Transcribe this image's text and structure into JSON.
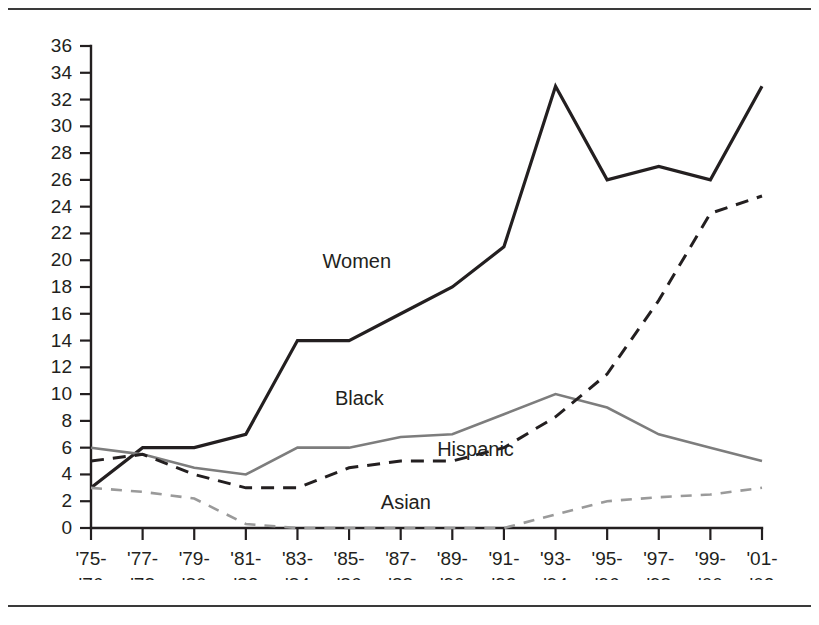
{
  "figure": {
    "top_rule": "",
    "bottom_rule": ""
  },
  "chart_data": {
    "type": "line",
    "title": "",
    "xlabel": "",
    "ylabel": "",
    "ylim": [
      0,
      36
    ],
    "ytick_step": 2,
    "grid": false,
    "legend_position": "inline-labels",
    "categories": [
      "'75-\n'76",
      "'77-\n'78",
      "'79-\n'80",
      "'81-\n'82",
      "'83-\n'84",
      "'85-\n'86",
      "'87-\n'88",
      "'89-\n'90",
      "'91-\n'92",
      "'93-\n'94",
      "'95-\n'96",
      "'97-\n'98",
      "'99-\n'00",
      "'01-\n'02"
    ],
    "categories_line1": [
      "'75-",
      "'77-",
      "'79-",
      "'81-",
      "'83-",
      "'85-",
      "'87-",
      "'89-",
      "'91-",
      "'93-",
      "'95-",
      "'97-",
      "'99-",
      "'01-"
    ],
    "categories_line2": [
      "'76",
      "'78",
      "'80",
      "'82",
      "'84",
      "'86",
      "'88",
      "'90",
      "'92",
      "'94",
      "'96",
      "'98",
      "'00",
      "'02"
    ],
    "yticks": [
      0,
      2,
      4,
      6,
      8,
      10,
      12,
      14,
      16,
      18,
      20,
      22,
      24,
      26,
      28,
      30,
      32,
      34,
      36
    ],
    "series": [
      {
        "name": "Women",
        "color": "#231f20",
        "style": "solid",
        "width": 3.2,
        "label_x_index": 5.15,
        "label_y_value": 19.4,
        "values": [
          3,
          6,
          6,
          7,
          14,
          14,
          16,
          18,
          21,
          33,
          26,
          27,
          26,
          33
        ]
      },
      {
        "name": "Black",
        "color": "#7d7d7d",
        "style": "solid",
        "width": 2.6,
        "label_x_index": 5.2,
        "label_y_value": 9.2,
        "values": [
          6,
          5.5,
          4.5,
          4,
          6,
          6,
          6.8,
          7,
          8.5,
          10,
          9,
          7,
          6,
          5
        ]
      },
      {
        "name": "Hispanic",
        "color": "#231f20",
        "style": "dashed",
        "width": 3.0,
        "label_x_index": 7.45,
        "label_y_value": 5.4,
        "values": [
          5,
          5.5,
          4,
          3,
          3,
          4.5,
          5,
          5,
          6,
          8.3,
          11.5,
          17,
          23.5,
          24.8
        ]
      },
      {
        "name": "Asian",
        "color": "#9a9a9a",
        "style": "dashed",
        "width": 2.6,
        "label_x_index": 6.1,
        "label_y_value": 1.45,
        "values": [
          3,
          2.7,
          2.2,
          0.3,
          0,
          0,
          0,
          0,
          0,
          1,
          2,
          2.3,
          2.5,
          3
        ]
      }
    ]
  }
}
